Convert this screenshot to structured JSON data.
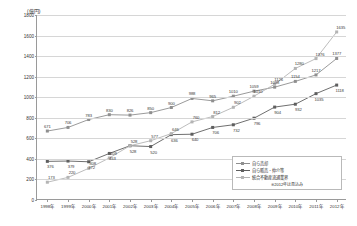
{
  "axis": {
    "unit_label": "(億円)",
    "ylabel": "",
    "xlabel": ""
  },
  "legend": {
    "items": [
      {
        "label": "自ら売却",
        "color": "#8f8f8f",
        "marker": "square"
      },
      {
        "label": "自ら販売・仲介等",
        "color": "#5f5f5f",
        "marker": "square"
      },
      {
        "label": "統合不動産流通業界",
        "color": "#b4b4b4",
        "marker": "square"
      }
    ],
    "note": "※2012年は見込み"
  },
  "chart_data": {
    "type": "line",
    "title": "",
    "xlabel": "",
    "ylabel": "(億円)",
    "ylim": [
      0,
      1800
    ],
    "yticks": [
      0,
      200,
      400,
      600,
      800,
      1000,
      1200,
      1400,
      1600,
      1800
    ],
    "grid": true,
    "legend_position": "bottom-right",
    "categories": [
      "1998年",
      "1999年",
      "2000年",
      "2001年",
      "2002年",
      "2003年",
      "2004年",
      "2005年",
      "2006年",
      "2007年",
      "2008年",
      "2009年",
      "2010年",
      "2011年",
      "2012年"
    ],
    "series": [
      {
        "name": "自ら売却",
        "color": "#8f8f8f",
        "values": [
          671,
          706,
          783,
          830,
          826,
          850,
          900,
          988,
          965,
          1010,
          1059,
          1098,
          1154,
          1217,
          1377
        ]
      },
      {
        "name": "自ら販売・仲介等",
        "color": "#5f5f5f",
        "values": [
          376,
          379,
          372,
          453,
          528,
          520,
          636,
          640,
          706,
          732,
          796,
          904,
          932,
          1035,
          1118
        ]
      },
      {
        "name": "統合不動産流通業界",
        "color": "#b4b4b4",
        "values": [
          173,
          220,
          308,
          409,
          528,
          577,
          646,
          760,
          812,
          902,
          1010,
          1126,
          1280,
          1376,
          1635
        ]
      }
    ],
    "point_labels": {
      "自ら売却": [
        "671",
        "706",
        "783",
        "830",
        "826",
        "850",
        "900",
        "988",
        "965",
        "1010",
        "1059",
        "1098",
        "1154",
        "1217",
        "1377"
      ],
      "自ら販売・仲介等": [
        "376",
        "379",
        "372",
        "453",
        "528",
        "520",
        "636",
        "640",
        "706",
        "732",
        "796",
        "904",
        "932",
        "1035",
        "1118"
      ],
      "統合不動産流通業界": [
        "173",
        "220",
        "308",
        "409",
        "528",
        "577",
        "646",
        "760",
        "812",
        "902",
        "1010",
        "1126",
        "1280",
        "1376",
        "1635"
      ]
    },
    "extra_labels": [
      "1051",
      "1076",
      "1110",
      "1503"
    ]
  }
}
